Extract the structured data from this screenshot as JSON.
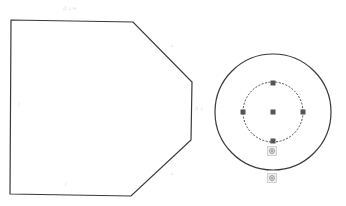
{
  "canvas": {
    "width": 346,
    "height": 206,
    "background": "#ffffff"
  },
  "colors": {
    "stroke": "#3a3a3a",
    "dashed": "#4a4a4a",
    "handle": "#555555",
    "glyph": "#d8d8d8",
    "icon_border": "#c8c8c8",
    "icon_fill": "#eeeeee"
  },
  "polygon": {
    "name": "hexagon-sketch",
    "points": [
      [
        11,
        20
      ],
      [
        133,
        22
      ],
      [
        192,
        82
      ],
      [
        191,
        140
      ],
      [
        131,
        196
      ],
      [
        10,
        194
      ]
    ]
  },
  "constraint_glyphs": [
    {
      "x": 63,
      "y": 10,
      "text": "// ⟂ ="
    },
    {
      "x": 170,
      "y": 47,
      "text": "⟂"
    },
    {
      "x": 195,
      "y": 110,
      "text": "// ⟂"
    },
    {
      "x": 18,
      "y": 106,
      "text": "/"
    },
    {
      "x": 65,
      "y": 186,
      "text": "/"
    },
    {
      "x": 170,
      "y": 175,
      "text": "⟂"
    }
  ],
  "outer_circle": {
    "cx": 273,
    "cy": 112,
    "r": 58
  },
  "inner_circle": {
    "cx": 273,
    "cy": 112,
    "r": 30,
    "dashed": true
  },
  "handles": [
    {
      "name": "handle-center",
      "x": 273,
      "y": 112
    },
    {
      "name": "handle-top",
      "x": 273,
      "y": 83
    },
    {
      "name": "handle-left",
      "x": 243,
      "y": 112
    },
    {
      "name": "handle-right",
      "x": 303,
      "y": 112
    },
    {
      "name": "handle-bottom",
      "x": 273,
      "y": 141
    }
  ],
  "target_icons": [
    {
      "name": "inner-circle-anchor-icon",
      "x": 272,
      "y": 151
    },
    {
      "name": "outer-circle-anchor-icon",
      "x": 272,
      "y": 178
    }
  ]
}
